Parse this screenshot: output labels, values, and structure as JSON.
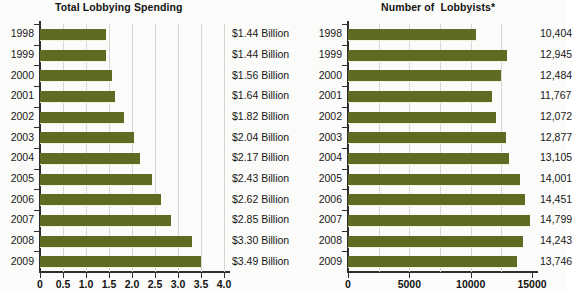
{
  "figure": {
    "footnote": ""
  },
  "charts": [
    {
      "id": "total-lobbying-spending",
      "title": "Total Lobbying Spending"
    },
    {
      "id": "number-of-lobbyists",
      "title": "Number of  Lobbyists*"
    }
  ],
  "chart_data": [
    {
      "type": "bar",
      "orientation": "horizontal",
      "title": "Total Lobbying Spending",
      "xlabel": "",
      "ylabel": "",
      "categories": [
        "1998",
        "1999",
        "2000",
        "2001",
        "2002",
        "2003",
        "2004",
        "2005",
        "2006",
        "2007",
        "2008",
        "2009"
      ],
      "values": [
        1.44,
        1.44,
        1.56,
        1.64,
        1.82,
        2.04,
        2.17,
        2.43,
        2.62,
        2.85,
        3.3,
        3.49
      ],
      "value_labels": [
        "$1.44 Billion",
        "$1.44 Billion",
        "$1.56 Billion",
        "$1.64 Billion",
        "$1.82 Billion",
        "$2.04 Billion",
        "$2.17 Billion",
        "$2.43 Billion",
        "$2.62 Billion",
        "$2.85 Billion",
        "$3.30 Billion",
        "$3.49 Billion"
      ],
      "xlim": [
        0,
        4.0
      ],
      "xticks": [
        0,
        0.5,
        1.0,
        1.5,
        2.0,
        2.5,
        3.0,
        3.5,
        4.0
      ],
      "xticklabels": [
        "0",
        "0.5",
        "1.0",
        "1.5",
        "2.0",
        "2.5",
        "3.0",
        "3.5",
        "4.0"
      ],
      "grid": true,
      "legend": null,
      "bar_color": "#5f6b22",
      "units": "Billions of US dollars"
    },
    {
      "type": "bar",
      "orientation": "horizontal",
      "title": "Number of  Lobbyists*",
      "xlabel": "",
      "ylabel": "",
      "categories": [
        "1998",
        "1999",
        "2000",
        "2001",
        "2002",
        "2003",
        "2004",
        "2005",
        "2006",
        "2007",
        "2008",
        "2009"
      ],
      "values": [
        10404,
        12945,
        12484,
        11767,
        12072,
        12877,
        13105,
        14001,
        14451,
        14799,
        14243,
        13746
      ],
      "value_labels": [
        "10,404",
        "12,945",
        "12,484",
        "11,767",
        "12,072",
        "12,877",
        "13,105",
        "14,001",
        "14,451",
        "14,799",
        "14,243",
        "13,746"
      ],
      "xlim": [
        0,
        15000
      ],
      "xticks": [
        0,
        5000,
        10000,
        15000
      ],
      "xticklabels": [
        "0",
        "5000",
        "10000",
        "15000"
      ],
      "gridticks": [
        2500,
        5000,
        7500,
        10000,
        12500
      ],
      "grid": true,
      "legend": null,
      "bar_color": "#5f6b22",
      "units": "count"
    }
  ]
}
